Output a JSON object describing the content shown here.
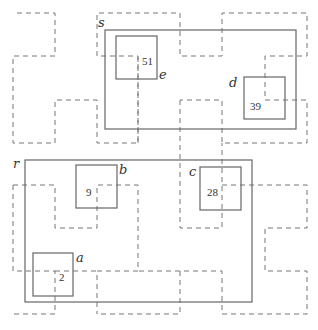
{
  "diagram": {
    "labels": {
      "s": "s",
      "e": "e",
      "d": "d",
      "r": "r",
      "b": "b",
      "c": "c",
      "a": "a"
    },
    "numbers": {
      "e": "51",
      "d": "39",
      "b": "9",
      "c": "28",
      "a": "2"
    },
    "large_rects": [
      {
        "name": "s",
        "x": 105,
        "y": 30,
        "w": 191,
        "h": 99
      },
      {
        "name": "r",
        "x": 25,
        "y": 160,
        "w": 227,
        "h": 142
      }
    ],
    "small_boxes": [
      {
        "name": "e",
        "number": "51",
        "x": 116,
        "y": 36,
        "w": 41,
        "h": 43
      },
      {
        "name": "d",
        "number": "39",
        "x": 244,
        "y": 77,
        "w": 41,
        "h": 42
      },
      {
        "name": "b",
        "number": "9",
        "x": 76,
        "y": 165,
        "w": 41,
        "h": 43
      },
      {
        "name": "c",
        "number": "28",
        "x": 200,
        "y": 167,
        "w": 41,
        "h": 43
      },
      {
        "name": "a",
        "number": "2",
        "x": 33,
        "y": 253,
        "w": 40,
        "h": 43
      }
    ],
    "stroke_colors": {
      "solid": "#666666",
      "dashed": "#777777"
    }
  }
}
